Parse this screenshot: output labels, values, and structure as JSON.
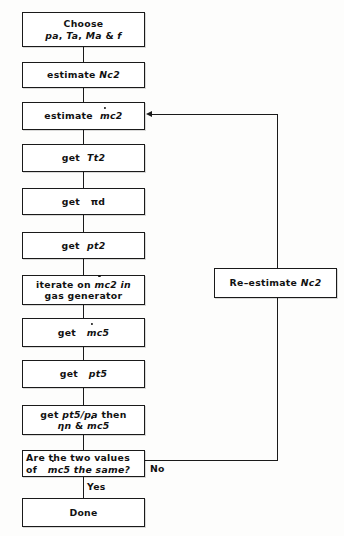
{
  "diagram": {
    "type": "flowchart",
    "background_color": "#fdfdfc",
    "line_color": "#1a1a1a",
    "box_fill": "#ffffff",
    "nodes": [
      {
        "id": "choose",
        "shape": "process",
        "lines": [
          "Choose",
          "pa, Ta, Ma & f"
        ],
        "line1": "Choose",
        "line2_parts": [
          "pa",
          ", ",
          "Ta",
          ", ",
          "Ma",
          " & ",
          "f"
        ]
      },
      {
        "id": "estimate-nc2",
        "shape": "process",
        "lines": [
          "estimate Nc2"
        ],
        "prefix": "estimate",
        "symbol": "Nc2"
      },
      {
        "id": "estimate-mc2",
        "shape": "process",
        "lines": [
          "estimate ṁc2"
        ],
        "prefix": "estimate",
        "symbol_dot": "m",
        "symbol_rest": "c2"
      },
      {
        "id": "get-tt2",
        "shape": "process",
        "lines": [
          "get Tt2"
        ],
        "prefix": "get",
        "symbol": "Tt2"
      },
      {
        "id": "get-pid",
        "shape": "process",
        "lines": [
          "get πd"
        ],
        "prefix": "get",
        "symbol": "πd"
      },
      {
        "id": "get-pt2",
        "shape": "process",
        "lines": [
          "get pt2"
        ],
        "prefix": "get",
        "symbol": "pt2"
      },
      {
        "id": "iterate-gas-generator",
        "shape": "process",
        "lines": [
          "iterate on ṁc2 in",
          "gas generator"
        ],
        "line1_prefix": "iterate on",
        "line1_dot": "m",
        "line1_rest": "c2 in",
        "line2": "gas generator"
      },
      {
        "id": "get-mc5",
        "shape": "process",
        "lines": [
          "get ṁc5"
        ],
        "prefix": "get",
        "symbol_dot": "m",
        "symbol_rest": "c5"
      },
      {
        "id": "get-pt5",
        "shape": "process",
        "lines": [
          "get pt5"
        ],
        "prefix": "get",
        "symbol": "pt5"
      },
      {
        "id": "get-pt5-pa",
        "shape": "process",
        "lines": [
          "get pt5/pa then",
          "ηn & ṁc5"
        ],
        "line1_prefix": "get",
        "line1_symbol": "pt5/pa",
        "line1_suffix": "then",
        "line2_eta": "ηn",
        "line2_amp": "&",
        "line2_dot": "m",
        "line2_rest": "c5"
      },
      {
        "id": "decision-two-values",
        "shape": "decision",
        "lines": [
          "Are the two values",
          "of ṁc5 the same?"
        ],
        "line1": "Are  the  two  values",
        "line2_prefix": "of",
        "line2_dot": "m",
        "line2_rest": "c5  the  same?"
      },
      {
        "id": "done",
        "shape": "terminal",
        "lines": [
          "Done"
        ],
        "label": "Done"
      },
      {
        "id": "re-estimate-nc2",
        "shape": "process",
        "lines": [
          "Re-estimate Nc2"
        ],
        "prefix": "Re–estimate",
        "symbol": "Nc2"
      }
    ],
    "edge_labels": {
      "no": "No",
      "yes": "Yes"
    }
  }
}
